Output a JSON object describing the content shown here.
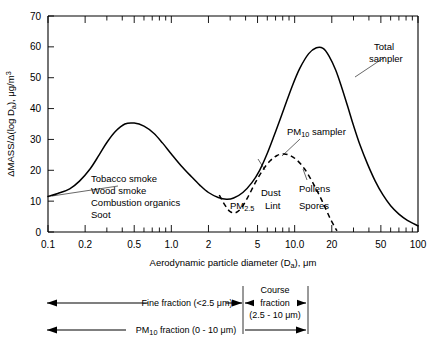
{
  "chart_data": {
    "type": "line",
    "title": "",
    "xlabel": "Aerodynamic particle diameter (Da), μm",
    "xlabel_main": "Aerodynamic particle diameter (D",
    "xlabel_sub": "a",
    "xlabel_tail": "), μm",
    "ylabel": "ΔMASS/Δ(log Da), μg/m3",
    "ylabel_main": "ΔMASS/Δ(log D",
    "ylabel_sub": "a",
    "ylabel_tail": "), μg/m",
    "ylabel_sup": "3",
    "xscale": "log",
    "xlim": [
      0.1,
      100
    ],
    "ylim": [
      0,
      70
    ],
    "grid": false,
    "legend": "inline-annotations",
    "xticks": [
      0.1,
      0.2,
      0.5,
      1.0,
      2,
      5,
      10.0,
      20,
      50,
      100
    ],
    "xticklabels": [
      "0.1",
      "0.2",
      "0.5",
      "1.0",
      "2",
      "5",
      "10.0",
      "20",
      "50",
      "100"
    ],
    "yticks": [
      0,
      10,
      20,
      30,
      40,
      50,
      60,
      70
    ],
    "yticklabels": [
      "0",
      "10",
      "20",
      "30",
      "40",
      "50",
      "60",
      "70"
    ],
    "series": [
      {
        "name": "Total sampler",
        "style": "solid",
        "points": [
          [
            0.1,
            11.5
          ],
          [
            0.12,
            12.5
          ],
          [
            0.15,
            14.0
          ],
          [
            0.18,
            16.5
          ],
          [
            0.22,
            20.5
          ],
          [
            0.26,
            25.0
          ],
          [
            0.3,
            29.0
          ],
          [
            0.35,
            32.5
          ],
          [
            0.42,
            35.0
          ],
          [
            0.5,
            35.3
          ],
          [
            0.6,
            34.3
          ],
          [
            0.72,
            32.0
          ],
          [
            0.85,
            28.8
          ],
          [
            1.0,
            25.3
          ],
          [
            1.2,
            21.5
          ],
          [
            1.45,
            18.0
          ],
          [
            1.7,
            15.2
          ],
          [
            2.0,
            12.8
          ],
          [
            2.4,
            11.2
          ],
          [
            2.8,
            10.6
          ],
          [
            3.2,
            11.0
          ],
          [
            3.8,
            12.8
          ],
          [
            4.5,
            16.0
          ],
          [
            5.2,
            20.0
          ],
          [
            6.0,
            25.5
          ],
          [
            7.0,
            32.5
          ],
          [
            8.2,
            40.0
          ],
          [
            9.5,
            47.0
          ],
          [
            11.0,
            53.0
          ],
          [
            13.0,
            57.8
          ],
          [
            15.0,
            59.7
          ],
          [
            17.0,
            59.5
          ],
          [
            19.0,
            57.0
          ],
          [
            21.5,
            52.5
          ],
          [
            24.0,
            47.0
          ],
          [
            27.0,
            40.5
          ],
          [
            30.0,
            34.5
          ],
          [
            34.0,
            28.0
          ],
          [
            39.0,
            22.0
          ],
          [
            45.0,
            16.5
          ],
          [
            52.0,
            12.0
          ],
          [
            60.0,
            8.5
          ],
          [
            70.0,
            5.8
          ],
          [
            82.0,
            3.8
          ],
          [
            100.0,
            2.0
          ]
        ]
      },
      {
        "name": "PM10 sampler",
        "style": "dashed",
        "points": [
          [
            2.45,
            12.0
          ],
          [
            2.6,
            10.0
          ],
          [
            2.8,
            8.0
          ],
          [
            3.0,
            6.6
          ],
          [
            3.3,
            6.2
          ],
          [
            3.7,
            7.8
          ],
          [
            4.2,
            11.5
          ],
          [
            4.8,
            16.0
          ],
          [
            5.5,
            20.0
          ],
          [
            6.3,
            23.0
          ],
          [
            7.2,
            24.8
          ],
          [
            8.2,
            25.3
          ],
          [
            9.2,
            24.8
          ],
          [
            10.5,
            23.2
          ],
          [
            12.0,
            20.5
          ],
          [
            13.5,
            17.2
          ],
          [
            15.0,
            13.8
          ],
          [
            16.5,
            10.5
          ],
          [
            18.0,
            7.2
          ],
          [
            19.5,
            4.2
          ],
          [
            21.0,
            1.8
          ],
          [
            22.0,
            0.4
          ]
        ]
      }
    ],
    "annotations": [
      {
        "name": "fine-mode-sources",
        "lines": [
          "Tobacco smoke",
          "Wood smoke",
          "Combustion organics",
          "Soot"
        ],
        "leader": true
      },
      {
        "name": "total-sampler-label",
        "lines": [
          "Total",
          "sampler"
        ],
        "leader": true
      },
      {
        "name": "pm10-sampler-label",
        "lines": [
          "PM10 sampler"
        ],
        "leader": true
      },
      {
        "name": "pm25-label",
        "lines": [
          "PM2.5"
        ],
        "leader": false
      },
      {
        "name": "dust-label",
        "lines": [
          "Dust"
        ],
        "leader": false
      },
      {
        "name": "lint-label",
        "lines": [
          "Lint"
        ],
        "leader": false
      },
      {
        "name": "pollens-label",
        "lines": [
          "Pollens"
        ],
        "leader": false
      },
      {
        "name": "spores-label",
        "lines": [
          "Spores"
        ],
        "leader": false
      }
    ]
  },
  "labels": {
    "total_sampler_line1": "Total",
    "total_sampler_line2": "sampler",
    "pm10_sampler_main": "PM",
    "pm10_sampler_sub": "10",
    "pm10_sampler_tail": " sampler",
    "pm25_main": "PM",
    "pm25_sub": "2.5",
    "dust": "Dust",
    "lint": "Lint",
    "pollens": "Pollens",
    "spores": "Spores",
    "source1": "Tobacco smoke",
    "source2": "Wood smoke",
    "source3": "Combustion organics",
    "source4": "Soot"
  },
  "brackets": {
    "fine": "Fine fraction (<2.5 μm)",
    "coarse_line1": "Course",
    "coarse_line2": "fraction",
    "coarse_line3": "(2.5 - 10 μm)",
    "pm10_main": "PM",
    "pm10_sub": "10",
    "pm10_tail": " fraction (0 - 10 μm)"
  },
  "axes": {
    "x_ticklabels": [
      "0.1",
      "0.2",
      "0.5",
      "1.0",
      "2",
      "5",
      "10.0",
      "20",
      "50",
      "100"
    ],
    "y_ticklabels": [
      "0",
      "10",
      "20",
      "30",
      "40",
      "50",
      "60",
      "70"
    ]
  },
  "colors": {
    "ink": "#000000",
    "background": "#ffffff"
  }
}
